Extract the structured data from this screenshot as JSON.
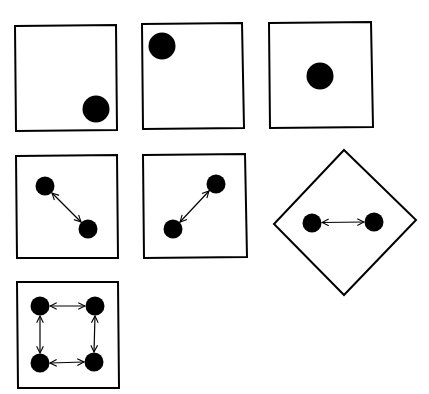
{
  "diagram": {
    "stroke_color": "#000000",
    "dot_color": "#000000",
    "background": "#ffffff",
    "panels": [
      {
        "id": "panel-1",
        "shape": "square",
        "dots": 1,
        "arrows": 0,
        "dot_position": "bottom-right"
      },
      {
        "id": "panel-2",
        "shape": "square",
        "dots": 1,
        "arrows": 0,
        "dot_position": "top-left"
      },
      {
        "id": "panel-3",
        "shape": "square",
        "dots": 1,
        "arrows": 0,
        "dot_position": "center"
      },
      {
        "id": "panel-4",
        "shape": "square",
        "dots": 2,
        "arrows": 1,
        "relation": "diagonal top-left to bottom-right"
      },
      {
        "id": "panel-5",
        "shape": "square",
        "dots": 2,
        "arrows": 1,
        "relation": "diagonal bottom-left to top-right"
      },
      {
        "id": "panel-6",
        "shape": "diamond",
        "dots": 2,
        "arrows": 1,
        "relation": "horizontal"
      },
      {
        "id": "panel-7",
        "shape": "square",
        "dots": 4,
        "arrows": 4,
        "relation": "square cycle"
      }
    ]
  }
}
